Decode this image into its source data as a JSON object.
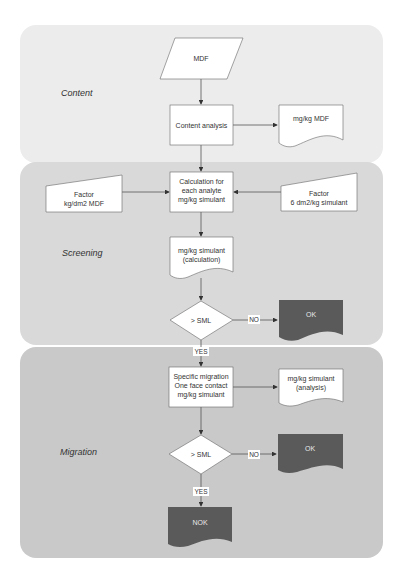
{
  "diagram": {
    "colors": {
      "content_panel": "#ececec",
      "screening_panel": "#d9d9d9",
      "migration_panel": "#c9c9c9",
      "node_fill": "#ffffff",
      "terminal_fill": "#5a5a5a",
      "terminal_text": "#e8e8e8",
      "line": "#555555"
    },
    "sections": [
      {
        "id": "content",
        "label": "Content"
      },
      {
        "id": "screening",
        "label": "Screening"
      },
      {
        "id": "migration",
        "label": "Migration"
      }
    ],
    "nodes": {
      "mdf": {
        "shape": "parallelogram",
        "lines": [
          "MDF"
        ]
      },
      "content_analysis": {
        "shape": "process",
        "lines": [
          "Content analysis"
        ]
      },
      "mgkg_mdf": {
        "shape": "document",
        "lines": [
          "mg/kg MDF"
        ]
      },
      "calculation": {
        "shape": "process",
        "lines": [
          "Calculation for",
          "each analyte",
          "mg/kg simulant"
        ]
      },
      "factor_left": {
        "shape": "manual-input",
        "lines": [
          "Factor",
          "kg/dm2 MDF"
        ]
      },
      "factor_right": {
        "shape": "manual-input",
        "lines": [
          "Factor",
          "6 dm2/kg simulant"
        ]
      },
      "mgkg_sim_calc": {
        "shape": "document",
        "lines": [
          "mg/kg simulant",
          "(calculation)"
        ]
      },
      "decision1": {
        "shape": "decision",
        "lines": [
          "> SML"
        ]
      },
      "ok1": {
        "shape": "document-dark",
        "lines": [
          "OK"
        ]
      },
      "specific_migration": {
        "shape": "process",
        "lines": [
          "Specific migration",
          "One face contact",
          "mg/kg simulant"
        ]
      },
      "mgkg_sim_analysis": {
        "shape": "document",
        "lines": [
          "mg/kg simulant",
          "(analysis)"
        ]
      },
      "decision2": {
        "shape": "decision",
        "lines": [
          "> SML"
        ]
      },
      "ok2": {
        "shape": "document-dark",
        "lines": [
          "OK"
        ]
      },
      "nok": {
        "shape": "document-dark",
        "lines": [
          "NOK"
        ]
      }
    },
    "edge_labels": {
      "d1_no": "NO",
      "d1_yes": "YES",
      "d2_no": "NO",
      "d2_yes": "YES"
    }
  }
}
